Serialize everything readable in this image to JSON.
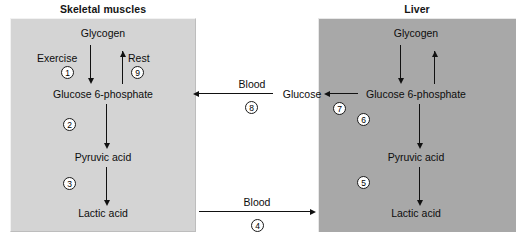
{
  "figure": {
    "title_left": "Skeletal muscles",
    "title_right": "Liver",
    "colors": {
      "muscle_panel": "#d4d4d4",
      "liver_panel": "#a8a8a8",
      "arrow": "#111111",
      "text": "#0d0d0d",
      "background": "#ffffff"
    }
  },
  "muscle": {
    "glycogen": "Glycogen",
    "glucose6p": "Glucose 6-phosphate",
    "pyruvic": "Pyruvic acid",
    "lactic": "Lactic acid",
    "exercise_label": "Exercise",
    "rest_label": "Rest",
    "step_exercise": "1",
    "step_rest": "9",
    "step_g6p_to_pyruvic": "2",
    "step_pyruvic_to_lactic": "3"
  },
  "liver": {
    "glycogen": "Glycogen",
    "glucose6p": "Glucose 6-phosphate",
    "pyruvic": "Pyruvic acid",
    "lactic": "Lactic acid",
    "glucose": "Glucose",
    "step_g6p_to_glucose": "7",
    "step_g6p_to_pyruvic": "6",
    "step_pyruvic_to_lactic": "5"
  },
  "transport": {
    "blood_top_label": "Blood",
    "blood_top_step": "8",
    "blood_bottom_label": "Blood",
    "blood_bottom_step": "4"
  }
}
